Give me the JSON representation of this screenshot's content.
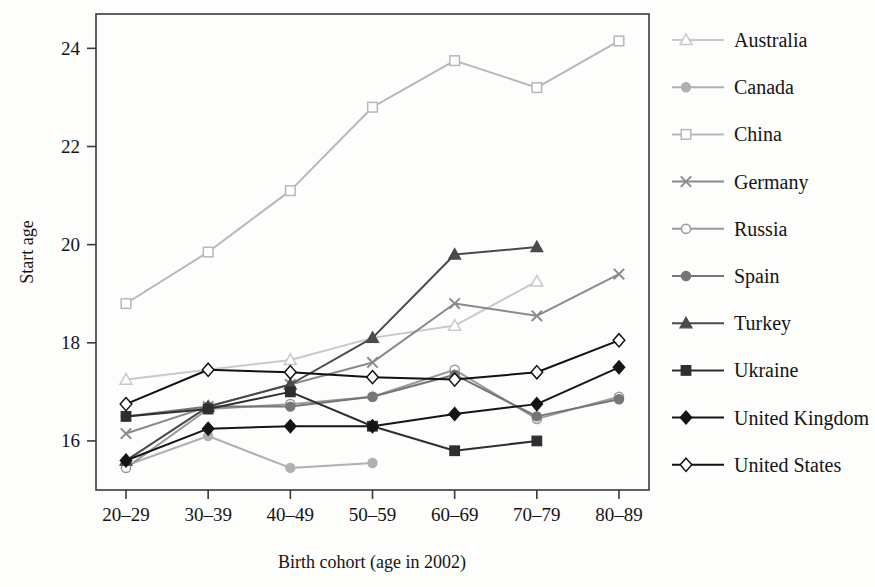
{
  "chart_data": {
    "type": "line",
    "title": "",
    "xlabel": "Birth cohort (age in 2002)",
    "ylabel": "Start age",
    "categories": [
      "20–29",
      "30–39",
      "40–49",
      "50–59",
      "60–69",
      "70–79",
      "80–89"
    ],
    "ylim": [
      15.0,
      24.7
    ],
    "yticks": [
      16,
      18,
      20,
      22,
      24
    ],
    "ytick_labels": [
      "16",
      "18",
      "20",
      "22",
      "24"
    ],
    "grid": false,
    "legend_position": "right",
    "series": [
      {
        "name": "Australia",
        "marker": "triangle-open",
        "color": "#c9c9c9",
        "values": [
          17.25,
          null,
          17.65,
          18.1,
          18.35,
          19.25,
          null
        ]
      },
      {
        "name": "Canada",
        "marker": "circle-filled",
        "color": "#b0b0b0",
        "values": [
          15.5,
          16.1,
          15.45,
          15.55,
          null,
          null,
          null
        ]
      },
      {
        "name": "China",
        "marker": "square-open",
        "color": "#b8b8b8",
        "values": [
          18.8,
          19.85,
          21.1,
          22.8,
          23.75,
          23.2,
          24.15
        ]
      },
      {
        "name": "Germany",
        "marker": "cross",
        "color": "#8a8a8a",
        "values": [
          16.15,
          16.7,
          17.15,
          17.6,
          18.8,
          18.55,
          19.4
        ]
      },
      {
        "name": "Russia",
        "marker": "circle-open",
        "color": "#9a9a9a",
        "values": [
          15.45,
          16.65,
          16.75,
          16.9,
          17.45,
          16.45,
          16.9
        ]
      },
      {
        "name": "Spain",
        "marker": "circle-filled",
        "color": "#757575",
        "values": [
          16.5,
          16.7,
          16.7,
          16.9,
          17.35,
          16.5,
          16.85
        ]
      },
      {
        "name": "Turkey",
        "marker": "triangle-filled",
        "color": "#4a4a4a",
        "values": [
          15.6,
          16.7,
          17.15,
          18.1,
          19.8,
          19.95,
          null
        ]
      },
      {
        "name": "Ukraine",
        "marker": "square-filled",
        "color": "#2e2e2e",
        "values": [
          16.5,
          16.65,
          17.0,
          16.3,
          15.8,
          16.0,
          null
        ]
      },
      {
        "name": "United Kingdom",
        "marker": "diamond-filled",
        "color": "#151515",
        "values": [
          15.6,
          16.25,
          16.3,
          16.3,
          16.55,
          16.75,
          17.5
        ]
      },
      {
        "name": "United States",
        "marker": "diamond-open",
        "color": "#111111",
        "values": [
          16.75,
          17.45,
          17.4,
          17.3,
          17.25,
          17.4,
          18.05
        ]
      }
    ]
  },
  "legend": {
    "items": [
      {
        "label": "Australia"
      },
      {
        "label": "Canada"
      },
      {
        "label": "China"
      },
      {
        "label": "Germany"
      },
      {
        "label": "Russia"
      },
      {
        "label": "Spain"
      },
      {
        "label": "Turkey"
      },
      {
        "label": "Ukraine"
      },
      {
        "label": "United Kingdom"
      },
      {
        "label": "United States"
      }
    ]
  }
}
